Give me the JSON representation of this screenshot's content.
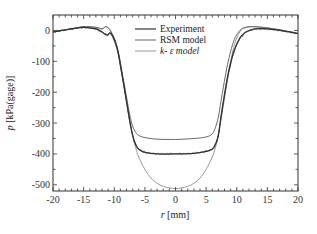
{
  "chart_data": {
    "type": "line",
    "title": "",
    "xlabel": "r [mm]",
    "ylabel": "p [kPa(gage)]",
    "xlim": [
      -20,
      20
    ],
    "ylim": [
      -520,
      50
    ],
    "xticks": [
      -20,
      -15,
      -10,
      -5,
      0,
      5,
      10,
      15,
      20
    ],
    "yticks": [
      0,
      -100,
      -200,
      -300,
      -400,
      -500
    ],
    "grid": false,
    "legend_position": "upper center",
    "series": [
      {
        "name": "Experiment",
        "color": "#333333",
        "noisy": true,
        "x": [
          -20,
          -17,
          -15,
          -13,
          -12,
          -11.2,
          -10.5,
          -9.5,
          -8.5,
          -7.5,
          -7,
          -6.5,
          -6,
          -5,
          -3,
          0,
          3,
          5,
          6,
          6.5,
          7,
          7.5,
          8.5,
          9.5,
          10.5,
          11.5,
          13,
          15,
          17,
          20
        ],
        "y": [
          -5,
          5,
          10,
          5,
          -5,
          -15,
          -10,
          -60,
          -170,
          -290,
          -340,
          -370,
          -385,
          -395,
          -400,
          -400,
          -398,
          -392,
          -385,
          -370,
          -340,
          -270,
          -150,
          -70,
          -25,
          -5,
          5,
          5,
          0,
          -10
        ]
      },
      {
        "name": "RSM model",
        "color": "#666666",
        "x": [
          -20,
          -17,
          -15,
          -13,
          -12,
          -11.3,
          -10.5,
          -9.5,
          -8.5,
          -7.5,
          -7,
          -6.5,
          -6,
          -5,
          -3,
          0,
          3,
          5,
          6,
          6.5,
          7,
          7.5,
          8.5,
          9.5,
          10.5,
          11.5,
          13,
          15,
          17,
          20
        ],
        "y": [
          -5,
          5,
          12,
          10,
          5,
          12,
          -5,
          -55,
          -160,
          -270,
          -310,
          -330,
          -340,
          -347,
          -352,
          -353,
          -350,
          -345,
          -335,
          -315,
          -280,
          -220,
          -110,
          -35,
          0,
          10,
          12,
          8,
          2,
          -10
        ]
      },
      {
        "name": "k- ε model",
        "color": "#999999",
        "x": [
          -20,
          -17,
          -15,
          -13,
          -12,
          -11.3,
          -10.5,
          -9.5,
          -8.5,
          -7.5,
          -7,
          -6.5,
          -6,
          -5,
          -4,
          -3,
          -2,
          -1,
          0,
          1,
          2,
          3,
          4,
          5,
          6,
          6.5,
          7,
          7.5,
          8.5,
          9.5,
          10.5,
          11.5,
          13,
          15,
          17,
          20
        ],
        "y": [
          -5,
          5,
          12,
          10,
          5,
          12,
          -5,
          -60,
          -170,
          -290,
          -340,
          -380,
          -410,
          -450,
          -478,
          -495,
          -505,
          -510,
          -512,
          -510,
          -505,
          -495,
          -478,
          -450,
          -410,
          -380,
          -340,
          -280,
          -160,
          -55,
          -5,
          10,
          12,
          8,
          2,
          -10
        ]
      }
    ]
  },
  "legend": {
    "items": [
      "Experiment",
      "RSM model",
      "k- ε model"
    ]
  },
  "axes": {
    "x_label_italic": "r",
    "x_label_unit": " [mm]",
    "y_label_italic": "p",
    "y_label_unit": " [kPa(gage)]"
  }
}
